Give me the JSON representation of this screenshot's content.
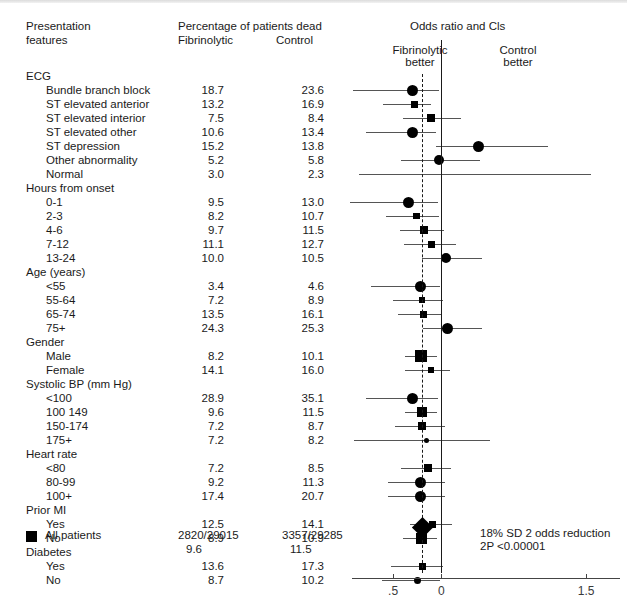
{
  "figure": {
    "left_header": {
      "line1": "Presentation",
      "line2": "features"
    },
    "mid_header": {
      "title": "Percentage of patients dead",
      "col1": "Fibrinolytic",
      "col2": "Control"
    },
    "plot_header": {
      "title": "Odds ratio and Cls",
      "left_label_line1": "Fibrinolytic",
      "left_label_line2": "better",
      "right_label_line1": "Control",
      "right_label_line2": "better"
    },
    "summary_note_line1": "18% SD 2 odds reduction",
    "summary_note_line2": "2P <0.00001",
    "all_patients_label": "All patients",
    "all_patients": {
      "fibrinolytic_ratio": "2820/29015",
      "control_ratio": "3357/29285",
      "fibrinolytic_pct": "9.6",
      "control_pct": "11.5"
    }
  },
  "chart_data": {
    "type": "forest",
    "title": "Odds ratio and Cls",
    "xlabel": "",
    "ylabel": "",
    "xticks": [
      ".5",
      "0",
      "1.5"
    ],
    "xtick_values": [
      -0.5,
      0,
      1.5
    ],
    "xlim": [
      -1.05,
      1.85
    ],
    "reference_line": 0,
    "pooled_line": -0.2,
    "grid": false,
    "legend_position": "none",
    "columns": [
      "Presentation features",
      "Fibrinolytic",
      "Control"
    ],
    "groups": [
      {
        "name": "ECG",
        "rows": [
          {
            "label": "Bundle branch block",
            "fibrinolytic": "18.7",
            "control": "23.6",
            "marker": "circle",
            "size": 5.5,
            "est": -0.3,
            "lo": -0.92,
            "hi": -0.02
          },
          {
            "label": "ST elevated anterior",
            "fibrinolytic": "13.2",
            "control": "16.9",
            "marker": "square",
            "size": 7,
            "est": -0.28,
            "lo": -0.6,
            "hi": -0.11
          },
          {
            "label": "ST elevated interior",
            "fibrinolytic": "7.5",
            "control": "8.4",
            "marker": "square",
            "size": 8,
            "est": -0.11,
            "lo": -0.4,
            "hi": 0.2
          },
          {
            "label": "ST elevated other",
            "fibrinolytic": "10.6",
            "control": "13.4",
            "marker": "circle",
            "size": 5.5,
            "est": -0.3,
            "lo": -0.78,
            "hi": -0.06
          },
          {
            "label": "ST depression",
            "fibrinolytic": "15.2",
            "control": "13.8",
            "marker": "circle",
            "size": 5.5,
            "est": 0.38,
            "lo": -0.06,
            "hi": 1.1
          },
          {
            "label": "Other abnormality",
            "fibrinolytic": "5.2",
            "control": "5.8",
            "marker": "circle",
            "size": 5,
            "est": -0.02,
            "lo": -0.42,
            "hi": 0.4
          },
          {
            "label": "Normal",
            "fibrinolytic": "3.0",
            "control": "2.3",
            "marker": "none",
            "size": 0,
            "est": 0.1,
            "lo": -0.85,
            "hi": 1.55
          }
        ]
      },
      {
        "name": "Hours from onset",
        "rows": [
          {
            "label": "0-1",
            "fibrinolytic": "9.5",
            "control": "13.0",
            "marker": "circle",
            "size": 5.5,
            "est": -0.34,
            "lo": -0.95,
            "hi": -0.04
          },
          {
            "label": "2-3",
            "fibrinolytic": "8.2",
            "control": "10.7",
            "marker": "square",
            "size": 6.5,
            "est": -0.26,
            "lo": -0.57,
            "hi": -0.02
          },
          {
            "label": "4-6",
            "fibrinolytic": "9.7",
            "control": "11.5",
            "marker": "square",
            "size": 8.5,
            "est": -0.18,
            "lo": -0.43,
            "hi": 0.03
          },
          {
            "label": "7-12",
            "fibrinolytic": "11.1",
            "control": "12.7",
            "marker": "square",
            "size": 7,
            "est": -0.1,
            "lo": -0.39,
            "hi": 0.15
          },
          {
            "label": "13-24",
            "fibrinolytic": "10.0",
            "control": "10.5",
            "marker": "circle",
            "size": 5,
            "est": 0.05,
            "lo": -0.2,
            "hi": 0.42
          }
        ]
      },
      {
        "name": "Age (years)",
        "rows": [
          {
            "label": "<55",
            "fibrinolytic": "3.4",
            "control": "4.6",
            "marker": "circle",
            "size": 5.5,
            "est": -0.22,
            "lo": -0.73,
            "hi": -0.01
          },
          {
            "label": "55-64",
            "fibrinolytic": "7.2",
            "control": "8.9",
            "marker": "square",
            "size": 6.5,
            "est": -0.2,
            "lo": -0.5,
            "hi": 0.02
          },
          {
            "label": "65-74",
            "fibrinolytic": "13.5",
            "control": "16.1",
            "marker": "square",
            "size": 7,
            "est": -0.19,
            "lo": -0.45,
            "hi": 0.0
          },
          {
            "label": "75+",
            "fibrinolytic": "24.3",
            "control": "25.3",
            "marker": "circle",
            "size": 5.5,
            "est": 0.06,
            "lo": -0.19,
            "hi": 0.42
          }
        ]
      },
      {
        "name": "Gender",
        "rows": [
          {
            "label": "Male",
            "fibrinolytic": "8.2",
            "control": "10.1",
            "marker": "square",
            "size": 12,
            "est": -0.21,
            "lo": -0.38,
            "hi": -0.05
          },
          {
            "label": "Female",
            "fibrinolytic": "14.1",
            "control": "16.0",
            "marker": "square",
            "size": 6.5,
            "est": -0.11,
            "lo": -0.38,
            "hi": 0.09
          }
        ]
      },
      {
        "name": "Systolic BP (mm Hg)",
        "rows": [
          {
            "label": "<100",
            "fibrinolytic": "28.9",
            "control": "35.1",
            "marker": "circle",
            "size": 5.5,
            "est": -0.3,
            "lo": -0.78,
            "hi": -0.04
          },
          {
            "label": "100 149",
            "fibrinolytic": "9.6",
            "control": "11.5",
            "marker": "square",
            "size": 10,
            "est": -0.2,
            "lo": -0.38,
            "hi": -0.05
          },
          {
            "label": "150-174",
            "fibrinolytic": "7.2",
            "control": "8.7",
            "marker": "square",
            "size": 7.5,
            "est": -0.2,
            "lo": -0.48,
            "hi": 0.04
          },
          {
            "label": "175+",
            "fibrinolytic": "7.2",
            "control": "8.2",
            "marker": "circle",
            "size": 2.5,
            "est": -0.15,
            "lo": -0.9,
            "hi": 0.5
          }
        ]
      },
      {
        "name": "Heart rate",
        "rows": [
          {
            "label": "<80",
            "fibrinolytic": "7.2",
            "control": "8.5",
            "marker": "square",
            "size": 7.5,
            "est": -0.14,
            "lo": -0.42,
            "hi": 0.1
          },
          {
            "label": "80-99",
            "fibrinolytic": "9.2",
            "control": "11.3",
            "marker": "circle",
            "size": 5.5,
            "est": -0.22,
            "lo": -0.55,
            "hi": 0.04
          },
          {
            "label": "100+",
            "fibrinolytic": "17.4",
            "control": "20.7",
            "marker": "circle",
            "size": 5.5,
            "est": -0.22,
            "lo": -0.55,
            "hi": 0.04
          }
        ]
      },
      {
        "name": "Prior MI",
        "rows": [
          {
            "label": "Yes",
            "fibrinolytic": "12.5",
            "control": "14.1",
            "marker": "square",
            "size": 7,
            "est": -0.09,
            "lo": -0.32,
            "hi": 0.11
          },
          {
            "label": "No",
            "fibrinolytic": "8.9",
            "control": "10.9",
            "marker": "square",
            "size": 11,
            "est": -0.21,
            "lo": -0.4,
            "hi": -0.05
          }
        ]
      },
      {
        "name": "Diabetes",
        "rows": [
          {
            "label": "Yes",
            "fibrinolytic": "13.6",
            "control": "17.3",
            "marker": "square",
            "size": 7,
            "est": -0.2,
            "lo": -0.52,
            "hi": 0.02
          },
          {
            "label": "No",
            "fibrinolytic": "8.7",
            "control": "10.2",
            "marker": "circle",
            "size": 3.5,
            "est": -0.25,
            "lo": -0.62,
            "hi": -0.01
          }
        ]
      }
    ],
    "overall": {
      "label": "All patients",
      "fibrinolytic_ratio": "2820/29015",
      "control_ratio": "3357/29285",
      "fibrinolytic_pct": "9.6",
      "control_pct": "11.5",
      "marker": "diamond",
      "est": -0.2,
      "lo": -0.27,
      "hi": -0.13,
      "annotation_line1": "18% SD 2 odds reduction",
      "annotation_line2": "2P <0.00001"
    }
  }
}
